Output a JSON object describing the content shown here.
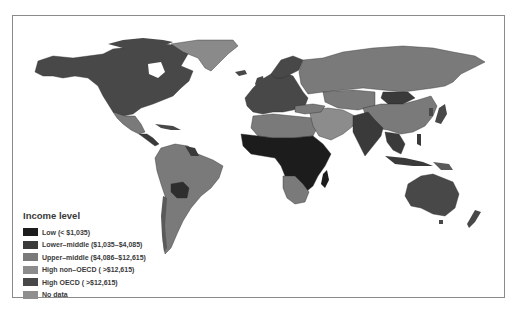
{
  "map": {
    "type": "choropleth",
    "subject": "World countries by income level",
    "colors": {
      "low": "#1c1c1c",
      "lower_middle": "#3a3a3a",
      "upper_middle": "#7a7a7a",
      "high_non_oecd": "#8c8c8c",
      "high_oecd": "#484848",
      "no_data": "#8f8f8f",
      "border": "#2a2a2a",
      "ocean": "#ffffff"
    }
  },
  "legend": {
    "title": "Income level",
    "items": [
      {
        "key": "low",
        "label": "Low (< $1,035)",
        "color": "#1c1c1c"
      },
      {
        "key": "lower_middle",
        "label": "Lower–middle ($1,035–$4,085)",
        "color": "#3a3a3a"
      },
      {
        "key": "upper_middle",
        "label": "Upper–middle ($4,086–$12,615)",
        "color": "#7a7a7a"
      },
      {
        "key": "high_non_oecd",
        "label": "High non–OECD ( >$12,615)",
        "color": "#8c8c8c"
      },
      {
        "key": "high_oecd",
        "label": "High OECD ( >$12,615)",
        "color": "#484848"
      },
      {
        "key": "no_data",
        "label": "No data",
        "color": "#8f8f8f"
      }
    ]
  }
}
